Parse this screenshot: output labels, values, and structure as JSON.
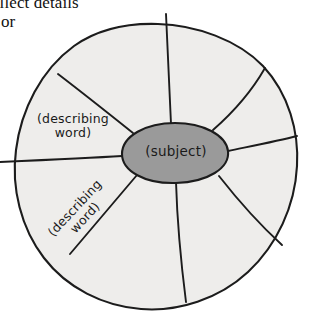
{
  "caption": {
    "line1": "ollect details",
    "line2": "or"
  },
  "diagram": {
    "name": "describing-wheel-graphic-organizer",
    "center_label": "(subject)",
    "spoke_labels": [
      "(describing word)",
      "(describing word)"
    ],
    "wedge_count": 8,
    "colors": {
      "wedge_fill": "#eeedeb",
      "center_fill": "#9a9a9a",
      "ink": "#1c1c1c",
      "page_background": "#ffffff"
    }
  }
}
